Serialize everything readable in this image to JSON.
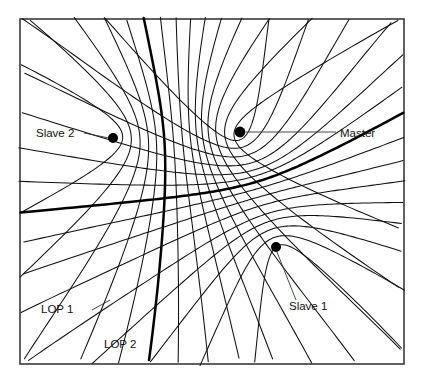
{
  "figure": {
    "kind": "hyperbolic-navigation-lop-diagram",
    "border_color": "#3a3a3a",
    "background_color": "#ffffff",
    "line_color": "#111111",
    "frame": {
      "x": 20,
      "y": 19,
      "width": 384,
      "height": 345
    },
    "stations": [
      {
        "id": "master",
        "label": "Master",
        "x": 240,
        "y": 132,
        "radius": 5.4
      },
      {
        "id": "slave2",
        "label": "Slave 2",
        "x": 113,
        "y": 138,
        "radius": 5.0
      },
      {
        "id": "slave1",
        "label": "Slave 1",
        "x": 276,
        "y": 247,
        "radius": 5.0
      }
    ],
    "labels": [
      {
        "id": "slave2-label",
        "text": "Slave 2",
        "x": 36,
        "y": 137,
        "anchor": "start"
      },
      {
        "id": "master-label",
        "text": "Master",
        "x": 340,
        "y": 137,
        "anchor": "start"
      },
      {
        "id": "slave1-label",
        "text": "Slave 1",
        "x": 289,
        "y": 310,
        "anchor": "start"
      },
      {
        "id": "lop1-label",
        "text": "LOP 1",
        "x": 41,
        "y": 313,
        "anchor": "start"
      },
      {
        "id": "lop2-label",
        "text": "LOP 2",
        "x": 104,
        "y": 348,
        "anchor": "start"
      }
    ],
    "leaders": [
      {
        "id": "slave2-leader",
        "x1": 84,
        "y1": 133,
        "x2": 109,
        "y2": 138
      },
      {
        "id": "master-leader",
        "x1": 246,
        "y1": 132,
        "x2": 336,
        "y2": 132
      },
      {
        "id": "slave1-leader",
        "x1": 277,
        "y1": 252,
        "x2": 296,
        "y2": 300
      },
      {
        "id": "lop1-leader",
        "x1": 92,
        "y1": 310,
        "x2": 110,
        "y2": 300
      }
    ],
    "families": [
      {
        "id": "family-master-slave2",
        "description": "Hyperbolic lines of position for the Master / Slave 2 pair",
        "highlighted_curve": "LOP 2",
        "curve_count": 13
      },
      {
        "id": "family-master-slave1",
        "description": "Hyperbolic lines of position for the Master / Slave 1 pair",
        "highlighted_curve": "LOP 1",
        "curve_count": 13
      }
    ]
  },
  "chart_data": {
    "type": "line",
    "title": "",
    "xlabel": "",
    "ylabel": "",
    "grid": false,
    "legend_position": "inline-annotations",
    "annotations": [
      "Master",
      "Slave 2",
      "Slave 1",
      "LOP 1",
      "LOP 2"
    ],
    "series": [
      {
        "name": "Master/Slave 2 LOPs",
        "values": [
          -0.9,
          -0.75,
          -0.6,
          -0.45,
          -0.3,
          -0.15,
          0,
          0.15,
          0.3,
          0.45,
          0.6,
          0.75,
          0.9
        ]
      },
      {
        "name": "Master/Slave 1 LOPs",
        "values": [
          -0.9,
          -0.75,
          -0.6,
          -0.45,
          -0.3,
          -0.15,
          0,
          0.15,
          0.3,
          0.45,
          0.6,
          0.75,
          0.9
        ]
      }
    ]
  }
}
